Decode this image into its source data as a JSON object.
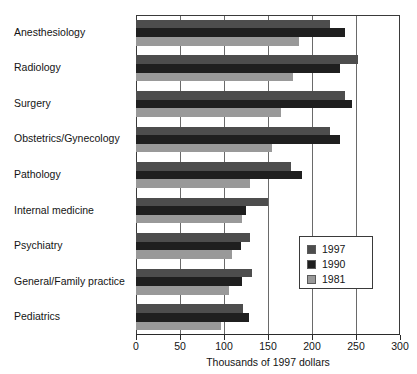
{
  "chart_data": {
    "type": "bar",
    "orientation": "horizontal",
    "title": "",
    "xlabel": "Thousands of 1997 dollars",
    "ylabel": "",
    "xlim": [
      0,
      300
    ],
    "xticks": [
      0,
      50,
      100,
      150,
      200,
      250,
      300
    ],
    "xticklabels": [
      "0",
      "50",
      "100",
      "150",
      "200",
      "250",
      "300"
    ],
    "grid": true,
    "legend_position": "center-right",
    "categories": [
      "Anesthesiology",
      "Radiology",
      "Surgery",
      "Obstetrics/Gynecology",
      "Pathology",
      "Internal medicine",
      "Psychiatry",
      "General/Family practice",
      "Pediatrics"
    ],
    "series": [
      {
        "name": "1997",
        "color": "#4d4d4d",
        "values": [
          220,
          252,
          237,
          220,
          176,
          150,
          129,
          132,
          122
        ]
      },
      {
        "name": "1990",
        "color": "#1f1f1f",
        "values": [
          237,
          232,
          246,
          232,
          189,
          125,
          119,
          120,
          128
        ]
      },
      {
        "name": "1981",
        "color": "#999999",
        "values": [
          185,
          178,
          165,
          154,
          130,
          120,
          109,
          106,
          97
        ]
      }
    ]
  },
  "legend": {
    "entries": [
      {
        "label": "1997",
        "color": "#4d4d4d"
      },
      {
        "label": "1990",
        "color": "#1f1f1f"
      },
      {
        "label": "1981",
        "color": "#999999"
      }
    ]
  }
}
